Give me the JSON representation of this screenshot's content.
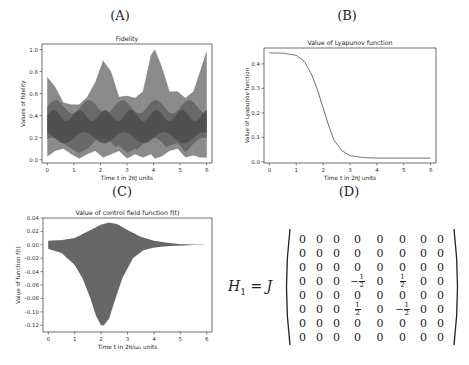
{
  "panels": {
    "a": {
      "label": "(A)"
    },
    "b": {
      "label": "(B)"
    },
    "c": {
      "label": "(C)"
    },
    "d": {
      "label": "(D)"
    }
  },
  "chart_data": [
    {
      "id": "A",
      "type": "area",
      "title": "Fidelity",
      "xlabel": "Time t in 2πJ units",
      "ylabel": "Values of fidelity",
      "xlim": [
        -0.2,
        6.2
      ],
      "ylim": [
        -0.03,
        1.05
      ],
      "xticks": [
        "0",
        "1",
        "2",
        "3",
        "4",
        "5",
        "6"
      ],
      "yticks": [
        "0.0",
        "0.2",
        "0.4",
        "0.6",
        "0.8",
        "1.0"
      ],
      "grid": false,
      "series": [
        {
          "name": "fidelity-envelope-upper",
          "x": [
            0,
            0.3,
            0.6,
            0.9,
            1.2,
            1.5,
            1.8,
            2.1,
            2.4,
            2.7,
            3.0,
            3.3,
            3.6,
            3.9,
            4.05,
            4.3,
            4.6,
            4.9,
            5.2,
            5.5,
            5.75,
            6.0
          ],
          "values": [
            0.75,
            0.66,
            0.52,
            0.5,
            0.5,
            0.57,
            0.7,
            0.9,
            0.8,
            0.57,
            0.58,
            0.56,
            0.62,
            0.95,
            1.0,
            0.85,
            0.62,
            0.62,
            0.56,
            0.62,
            0.8,
            0.99
          ]
        },
        {
          "name": "fidelity-envelope-lower",
          "x": [
            0,
            0.3,
            0.6,
            0.9,
            1.2,
            1.5,
            1.8,
            2.1,
            2.4,
            2.7,
            3.0,
            3.3,
            3.6,
            3.9,
            4.05,
            4.3,
            4.6,
            4.9,
            5.2,
            5.5,
            5.75,
            6.0
          ],
          "values": [
            0.03,
            0.08,
            0.1,
            0.05,
            0.01,
            0.05,
            0.08,
            0.02,
            0.05,
            0.08,
            0.01,
            0.05,
            0.02,
            0.05,
            0.01,
            0.03,
            0.08,
            0.1,
            0.02,
            0.04,
            0.02,
            0.02
          ]
        }
      ]
    },
    {
      "id": "B",
      "type": "line",
      "title": "Value of Lyapunov function",
      "xlabel": "Time t in 2πJ units",
      "ylabel": "Value of Lyapunov function",
      "xlim": [
        -0.2,
        6.2
      ],
      "ylim": [
        -0.005,
        0.465
      ],
      "xticks": [
        "0",
        "1",
        "2",
        "3",
        "4",
        "5",
        "6"
      ],
      "yticks": [
        "0.0",
        "0.1",
        "0.2",
        "0.3",
        "0.4"
      ],
      "grid": false,
      "series": [
        {
          "name": "lyapunov",
          "x": [
            0,
            0.5,
            1.0,
            1.3,
            1.6,
            1.8,
            2.0,
            2.2,
            2.4,
            2.7,
            3.0,
            3.5,
            4.0,
            5.0,
            6.0
          ],
          "values": [
            0.445,
            0.444,
            0.435,
            0.41,
            0.35,
            0.29,
            0.22,
            0.15,
            0.09,
            0.045,
            0.025,
            0.017,
            0.015,
            0.015,
            0.015
          ]
        }
      ]
    },
    {
      "id": "C",
      "type": "area",
      "title": "Value of control field function f(t)",
      "xlabel": "Time t in 2π/ω₁ units",
      "ylabel": "Value of function f(t)",
      "xlim": [
        -0.2,
        6.2
      ],
      "ylim": [
        -0.13,
        0.04
      ],
      "xticks": [
        "0",
        "1",
        "2",
        "3",
        "4",
        "5",
        "6"
      ],
      "yticks": [
        "0.04",
        "0.02",
        "0.00",
        "-0.02",
        "-0.04",
        "-0.06",
        "-0.08",
        "-0.10",
        "-0.12"
      ],
      "grid": false,
      "series": [
        {
          "name": "field-envelope-upper",
          "x": [
            0,
            0.5,
            1.0,
            1.5,
            2.0,
            2.3,
            2.6,
            3.0,
            3.5,
            4.0,
            4.5,
            5.0,
            5.5,
            6.0
          ],
          "values": [
            0.006,
            0.007,
            0.01,
            0.02,
            0.03,
            0.033,
            0.031,
            0.022,
            0.012,
            0.006,
            0.003,
            0.001,
            0.0003,
            0.0
          ]
        },
        {
          "name": "field-envelope-lower",
          "x": [
            0,
            0.5,
            1.0,
            1.3,
            1.6,
            1.8,
            2.0,
            2.1,
            2.3,
            2.5,
            2.8,
            3.2,
            3.6,
            4.0,
            4.5,
            5.0,
            5.5,
            6.0
          ],
          "values": [
            -0.006,
            -0.012,
            -0.03,
            -0.05,
            -0.08,
            -0.105,
            -0.12,
            -0.12,
            -0.11,
            -0.085,
            -0.05,
            -0.02,
            -0.008,
            -0.004,
            -0.002,
            -0.001,
            -0.0003,
            0.0
          ]
        }
      ]
    },
    {
      "id": "D",
      "type": "table",
      "title": "H1 = J × matrix",
      "lhs": "H",
      "lhs_sub": "1",
      "factor": "J",
      "matrix": [
        [
          "0",
          "0",
          "0",
          "0",
          "0",
          "0",
          "0",
          "0"
        ],
        [
          "0",
          "0",
          "0",
          "0",
          "0",
          "0",
          "0",
          "0"
        ],
        [
          "0",
          "0",
          "0",
          "0",
          "0",
          "0",
          "0",
          "0"
        ],
        [
          "0",
          "0",
          "0",
          "-1/2",
          "0",
          "1/2",
          "0",
          "0"
        ],
        [
          "0",
          "0",
          "0",
          "0",
          "0",
          "0",
          "0",
          "0"
        ],
        [
          "0",
          "0",
          "0",
          "1/2",
          "0",
          "-1/2",
          "0",
          "0"
        ],
        [
          "0",
          "0",
          "0",
          "0",
          "0",
          "0",
          "0",
          "0"
        ],
        [
          "0",
          "0",
          "0",
          "0",
          "0",
          "0",
          "0",
          "0"
        ]
      ]
    }
  ],
  "colors": {
    "axes": "#333333",
    "fill_dark": "#4a4a4a",
    "fill_mid": "#6e6e6e",
    "fill_light": "#9a9a9a",
    "line": "#555555",
    "text": "#222222"
  }
}
